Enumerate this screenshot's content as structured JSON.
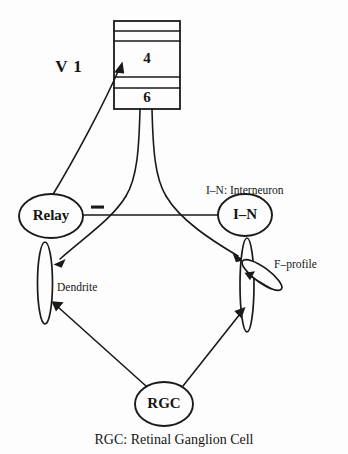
{
  "figure": {
    "background_color": "#fdfdfd",
    "ink_color": "#1a1a18"
  },
  "cortex": {
    "label": "V 1",
    "layers": [
      {
        "name": "layer-band-1",
        "label": ""
      },
      {
        "name": "layer-band-2",
        "label": ""
      },
      {
        "name": "layer-band-4",
        "label": "4"
      },
      {
        "name": "layer-band-5",
        "label": ""
      },
      {
        "name": "layer-band-6",
        "label": "6"
      }
    ]
  },
  "nodes": {
    "relay": {
      "label": "Relay"
    },
    "interneuron": {
      "label": "I–N"
    },
    "rgc": {
      "label": "RGC"
    }
  },
  "annotations": {
    "interneuron_legend": "I–N: Interneuron",
    "f_profile": "F–profile",
    "dendrite": "Dendrite",
    "inhibitory_sign": "−",
    "caption": "RGC: Retinal Ganglion Cell"
  },
  "connections": [
    {
      "name": "relay-to-layer4",
      "from": "Relay",
      "to": "4",
      "type": "excitatory-arrow"
    },
    {
      "name": "layer6-to-relay-dendrite",
      "from": "6",
      "to": "Relay dendrite",
      "type": "excitatory-arrow"
    },
    {
      "name": "layer6-to-interneuron-dendrite",
      "from": "6",
      "to": "I–N dendrite",
      "type": "excitatory-arrow"
    },
    {
      "name": "interneuron-to-relay",
      "from": "I–N",
      "to": "Relay",
      "type": "inhibitory-arrow",
      "sign": "−"
    },
    {
      "name": "rgc-to-relay-dendrite",
      "from": "RGC",
      "to": "Relay dendrite",
      "type": "excitatory-arrow"
    },
    {
      "name": "rgc-to-interneuron-dendrite",
      "from": "RGC",
      "to": "I–N dendrite",
      "type": "excitatory-arrow"
    },
    {
      "name": "f-profile-to-relay-dendrite",
      "from": "F–profile",
      "to": "I–N dendrite",
      "type": "excitatory-arrow"
    }
  ]
}
